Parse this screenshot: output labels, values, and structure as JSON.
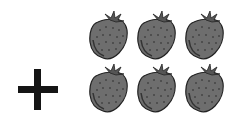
{
  "scene": {
    "operator": "+",
    "icon": "strawberry-icon",
    "rows": 2,
    "columns": 3,
    "count": 6,
    "colors": {
      "berry": "#6e6e6e",
      "outline": "#222222",
      "leaf": "#555555",
      "operator": "#151515"
    }
  },
  "items": [
    {
      "col": 0,
      "row": 0
    },
    {
      "col": 1,
      "row": 0
    },
    {
      "col": 2,
      "row": 0
    },
    {
      "col": 0,
      "row": 1
    },
    {
      "col": 1,
      "row": 1
    },
    {
      "col": 2,
      "row": 1
    }
  ]
}
